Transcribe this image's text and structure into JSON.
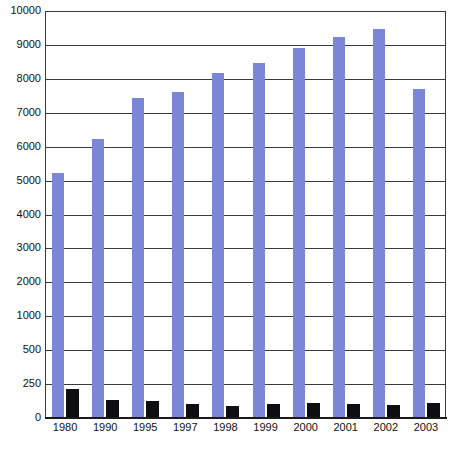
{
  "chart_data": {
    "type": "bar",
    "title": "",
    "subtitle": "",
    "xlabel": "",
    "ylabel": "",
    "categories": [
      "1980",
      "1990",
      "1995",
      "1997",
      "1998",
      "1999",
      "2000",
      "2001",
      "2002",
      "2003"
    ],
    "series": [
      {
        "name": "series-blue",
        "color": "#7b86d6",
        "values": [
          5180,
          6200,
          7400,
          7570,
          8150,
          8430,
          8880,
          9200,
          9430,
          7670
        ]
      },
      {
        "name": "series-black",
        "color": "#0d0d12",
        "values": [
          205,
          125,
          115,
          95,
          80,
          95,
          105,
          95,
          90,
          100
        ]
      }
    ],
    "yticks": [
      0,
      250,
      500,
      1000,
      2000,
      3000,
      4000,
      5000,
      6000,
      7000,
      8000,
      9000,
      10000
    ],
    "ytick_labels": [
      "0",
      "250",
      "500",
      "1000",
      "2000",
      "3000",
      "4000",
      "5000",
      "6000",
      "7000",
      "8000",
      "9000",
      "10000"
    ],
    "y_axis_scale": "non-uniform-ordinal",
    "ylim": [
      0,
      10000
    ],
    "grid": true,
    "grid_color": "#3a3a3a",
    "legend": false,
    "legend_position": "none",
    "plot_background": "#ffffff",
    "annotations": []
  }
}
